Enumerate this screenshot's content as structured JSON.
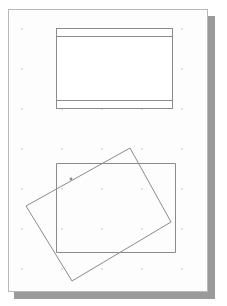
{
  "workspace": {
    "name": "drawing-canvas",
    "background_color": "#ffffff"
  },
  "page": {
    "name": "page-sheet",
    "fill_color": "#fdfdfd",
    "border_color": "#b9b9b9",
    "shadow_color": "#9a9a9a",
    "x": 8,
    "y": 9,
    "width": 200,
    "height": 283,
    "orientation": "portrait"
  },
  "grid": {
    "name": "dot-grid",
    "visible": true,
    "dot_color": "#e2e2e2",
    "spacing_px": 40
  },
  "shapes": [
    {
      "id": "banded-rectangle",
      "label": "Banded Rectangle",
      "type": "rectangle-with-bands",
      "stroke_color": "#8b8b8b",
      "fill_color": "#ffffff",
      "stroke_width": 1,
      "x": 56,
      "y": 28,
      "width": 116,
      "height": 80,
      "band_lines_y": [
        36,
        100
      ],
      "selected": false
    },
    {
      "id": "upright-rectangle",
      "label": "Upright Rectangle",
      "type": "rectangle",
      "stroke_color": "#8b8b8b",
      "fill_color": "none",
      "stroke_width": 1,
      "x": 56,
      "y": 163,
      "width": 119,
      "height": 89,
      "rotation_deg": 0,
      "selected": false
    },
    {
      "id": "rotated-rectangle",
      "label": "Rotated Rectangle",
      "type": "rectangle",
      "stroke_color": "#8b8b8b",
      "fill_color": "none",
      "stroke_width": 1,
      "rotation_deg": -20,
      "corners": [
        {
          "x": 130,
          "y": 148
        },
        {
          "x": 171,
          "y": 222
        },
        {
          "x": 72,
          "y": 281
        },
        {
          "x": 26,
          "y": 206
        }
      ],
      "selected": false
    }
  ],
  "markers": [
    {
      "id": "edge-handle",
      "label": "Edge Handle",
      "x": 71,
      "y": 179,
      "color": "#8d8d8d",
      "radius": 1.4
    }
  ]
}
